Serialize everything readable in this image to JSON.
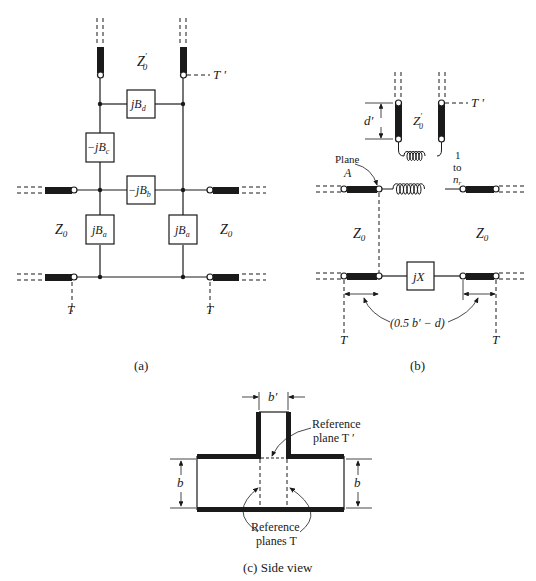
{
  "figure": {
    "panel_a": {
      "caption": "(a)",
      "elements": {
        "jBd": "jB",
        "jBd_sub": "d",
        "jBc": "−jB",
        "jBc_sub": "c",
        "jBb": "−jB",
        "jBb_sub": "b",
        "jBa_left": "jB",
        "jBa_left_sub": "a",
        "jBa_right": "jB",
        "jBa_right_sub": "a"
      },
      "labels": {
        "z0_prime": "Z",
        "z0_prime_sub": "0",
        "z0_prime_sup": "′",
        "t_prime": "T ′",
        "z0_left": "Z",
        "z0_left_sub": "0",
        "z0_right": "Z",
        "z0_right_sub": "0",
        "t_left": "T",
        "t_right": "T"
      }
    },
    "panel_b": {
      "caption": "(b)",
      "labels": {
        "d_prime": "d′",
        "z0_prime": "Z",
        "z0_prime_sub": "0",
        "z0_prime_sup": "′",
        "t_prime": "T ′",
        "plane": "Plane",
        "plane_a": "A",
        "ratio_1": "1",
        "ratio_to": "to",
        "ratio_n": "n",
        "ratio_n_sub": "r",
        "z0_left": "Z",
        "z0_left_sub": "0",
        "z0_right": "Z",
        "z0_right_sub": "0",
        "jx": "jX",
        "offset": "(0.5 b′ − d)",
        "t_left": "T",
        "t_right": "T"
      }
    },
    "panel_c": {
      "caption": "(c)  Side view",
      "labels": {
        "b_prime": "b′",
        "ref_plane_t_prime_1": "Reference",
        "ref_plane_t_prime_2": "plane T ′",
        "b_left": "b",
        "b_right": "b",
        "ref_planes_t_1": "Reference",
        "ref_planes_t_2": "planes T"
      }
    }
  }
}
